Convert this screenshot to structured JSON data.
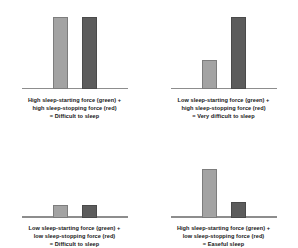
{
  "figure": {
    "legend": {
      "start_force_label": "sleep-starting force (green)",
      "stop_force_label": "sleep-stopping force (red)"
    },
    "colors": {
      "start_force": "#a3a3a3",
      "stop_force": "#5c5c5c",
      "baseline": "#8d8d8d",
      "background": "#ffffff",
      "text": "#171717"
    }
  },
  "chart_data": {
    "type": "bar",
    "xlabel": "",
    "ylabel": "",
    "ylim": [
      0,
      100
    ],
    "grid": false,
    "legend_position": "none",
    "categories": [
      "sleep-starting force (green)",
      "sleep-stopping force (red)"
    ],
    "panels": [
      {
        "id": "panel-1",
        "values": [
          100,
          100
        ],
        "series": [
          {
            "name": "sleep-starting force (green)",
            "value": 100,
            "level": "high"
          },
          {
            "name": "sleep-stopping force (red)",
            "value": 100,
            "level": "high"
          }
        ],
        "caption": {
          "line1": "High sleep-starting force (green) +",
          "line2": "high sleep-stopping force (red)",
          "line3": "= Difficult to sleep"
        },
        "outcome": "Difficult to sleep"
      },
      {
        "id": "panel-2",
        "values": [
          40,
          100
        ],
        "series": [
          {
            "name": "sleep-starting force (green)",
            "value": 40,
            "level": "low"
          },
          {
            "name": "sleep-stopping force (red)",
            "value": 100,
            "level": "high"
          }
        ],
        "caption": {
          "line1": "Low sleep-starting force (green) +",
          "line2": "high sleep-stopping force (red)",
          "line3": "= Very difficult to sleep"
        },
        "outcome": "Very difficult to sleep"
      },
      {
        "id": "panel-3",
        "values": [
          27,
          27
        ],
        "series": [
          {
            "name": "sleep-starting force (green)",
            "value": 27,
            "level": "low"
          },
          {
            "name": "sleep-stopping force (red)",
            "value": 27,
            "level": "low"
          }
        ],
        "caption": {
          "line1": "Low sleep-starting force (green) +",
          "line2": "low sleep-stopping force (red)",
          "line3": "= Difficult to sleep"
        },
        "outcome": "Difficult to sleep"
      },
      {
        "id": "panel-4",
        "values": [
          100,
          33
        ],
        "series": [
          {
            "name": "sleep-starting force (green)",
            "value": 100,
            "level": "high"
          },
          {
            "name": "sleep-stopping force (red)",
            "value": 33,
            "level": "low"
          }
        ],
        "caption": {
          "line1": "High sleep-starting force (green) +",
          "line2": "low sleep-stopping force (red)",
          "line3": "= Easeful sleep"
        },
        "outcome": "Easeful sleep"
      }
    ]
  }
}
